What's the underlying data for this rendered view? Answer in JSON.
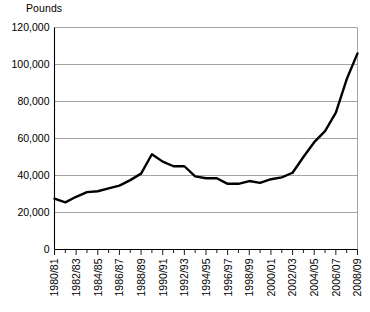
{
  "chart_data": {
    "type": "line",
    "title": "",
    "subtitle": "",
    "ylabel": "Pounds",
    "xlabel": "",
    "ylim": [
      0,
      120000
    ],
    "ytick_values": [
      0,
      20000,
      40000,
      60000,
      80000,
      100000,
      120000
    ],
    "ytick_labels": [
      "0",
      "20,000",
      "40,000",
      "60,000",
      "80,000",
      "100,000",
      "120,000"
    ],
    "grid": true,
    "legend": "none",
    "categories": [
      "1980/81",
      "1981/82",
      "1982/83",
      "1983/84",
      "1984/85",
      "1985/86",
      "1986/87",
      "1987/88",
      "1988/89",
      "1989/90",
      "1990/91",
      "1991/92",
      "1992/93",
      "1993/94",
      "1994/95",
      "1995/96",
      "1996/97",
      "1997/98",
      "1998/99",
      "1999/00",
      "2000/01",
      "2001/02",
      "2002/03",
      "2003/04",
      "2004/05",
      "2005/06",
      "2006/07",
      "2007/08",
      "2008/09"
    ],
    "xtick_labels": [
      "1980/81",
      "1982/83",
      "1984/85",
      "1986/87",
      "1988/89",
      "1990/91",
      "1992/93",
      "1994/95",
      "1996/97",
      "1998/99",
      "2000/01",
      "2002/03",
      "2004/05",
      "2006/07",
      "2008/09"
    ],
    "values": [
      27500,
      25500,
      28500,
      31000,
      31500,
      33000,
      34500,
      37500,
      41000,
      51500,
      47500,
      45000,
      45000,
      39500,
      38500,
      38500,
      35500,
      35500,
      37000,
      36000,
      38000,
      39000,
      41500,
      50000,
      58000,
      64000,
      74000,
      92000,
      106000
    ],
    "series": [
      {
        "name": "Pounds",
        "color": "#000000",
        "values": [
          27500,
          25500,
          28500,
          31000,
          31500,
          33000,
          34500,
          37500,
          41000,
          51500,
          47500,
          45000,
          45000,
          39500,
          38500,
          38500,
          35500,
          35500,
          37000,
          36000,
          38000,
          39000,
          41500,
          50000,
          58000,
          64000,
          74000,
          92000,
          106000
        ]
      }
    ]
  }
}
